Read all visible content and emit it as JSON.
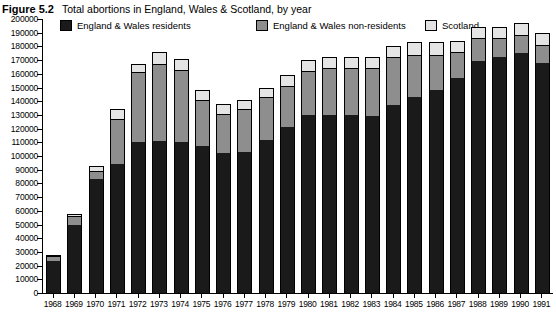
{
  "figure": {
    "number": "Figure 5.2",
    "title": "Total abortions in England, Wales & Scotland, by year"
  },
  "legend": {
    "position": "top",
    "items": [
      {
        "label": "England & Wales residents",
        "color": "#1a1a1a",
        "icon": "legend-swatch-icon"
      },
      {
        "label": "England & Wales non-residents",
        "color": "#8e8e8e",
        "icon": "legend-swatch-icon"
      },
      {
        "label": "Scotland",
        "color": "#e4e4e4",
        "icon": "legend-swatch-icon"
      }
    ]
  },
  "chart_data": {
    "type": "bar",
    "stacked": true,
    "title": "Total abortions in England, Wales & Scotland, by year",
    "xlabel": "",
    "ylabel": "",
    "ylim": [
      0,
      200000
    ],
    "ytick_step": 10000,
    "grid": false,
    "legend_position": "top",
    "categories": [
      "1968",
      "1969",
      "1970",
      "1971",
      "1972",
      "1973",
      "1974",
      "1975",
      "1976",
      "1977",
      "1978",
      "1979",
      "1980",
      "1981",
      "1982",
      "1983",
      "1984",
      "1985",
      "1986",
      "1987",
      "1988",
      "1989",
      "1990",
      "1991"
    ],
    "ytick_labels": [
      "0",
      "10000",
      "20000",
      "30000",
      "40000",
      "50000",
      "60000",
      "70000",
      "80000",
      "90000",
      "100000",
      "110000",
      "120000",
      "130000",
      "140000",
      "150000",
      "160000",
      "170000",
      "180000",
      "190000",
      "200000"
    ],
    "series": [
      {
        "name": "England & Wales residents",
        "color": "#1a1a1a",
        "values": [
          23600,
          50000,
          83000,
          94000,
          110000,
          111000,
          110000,
          107000,
          102000,
          103000,
          112000,
          121000,
          130000,
          130000,
          130000,
          129000,
          137000,
          143000,
          148000,
          157000,
          169000,
          172000,
          175000,
          168000
        ]
      },
      {
        "name": "England & Wales non-residents",
        "color": "#8e8e8e",
        "values": [
          3200,
          6000,
          6000,
          33000,
          51000,
          56000,
          53000,
          34000,
          29000,
          31000,
          31000,
          30000,
          32000,
          34000,
          34000,
          35000,
          35000,
          31000,
          26000,
          19000,
          17000,
          14000,
          13000,
          13000
        ]
      },
      {
        "name": "Scotland",
        "color": "#e4e4e4",
        "values": [
          1200,
          2000,
          4000,
          7000,
          6000,
          9000,
          8000,
          7000,
          7000,
          7000,
          7000,
          8000,
          8000,
          8000,
          8000,
          8000,
          8000,
          9000,
          9000,
          8000,
          8000,
          8000,
          9000,
          9000
        ]
      }
    ],
    "totals": [
      28000,
      58000,
      93000,
      134000,
      167000,
      176000,
      171000,
      148000,
      138000,
      141000,
      150000,
      159000,
      170000,
      172000,
      172000,
      172000,
      180000,
      183000,
      183000,
      184000,
      194000,
      194000,
      197000,
      190000
    ]
  }
}
